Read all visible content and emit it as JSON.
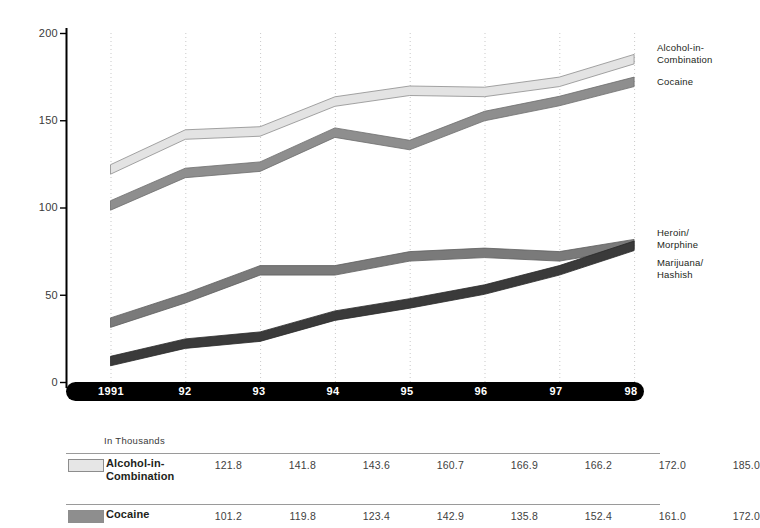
{
  "chart_data": {
    "type": "line",
    "title": "",
    "subtitle": "",
    "xlabel": "",
    "ylabel": "",
    "units_note": "In Thousands",
    "categories": [
      "1991",
      "92",
      "93",
      "94",
      "95",
      "96",
      "97",
      "98"
    ],
    "x_tick_labels": [
      "1991",
      "92",
      "93",
      "94",
      "95",
      "96",
      "97",
      "98"
    ],
    "y_tick_labels": [
      "0",
      "50",
      "100",
      "150",
      "200"
    ],
    "y_ticks": [
      0,
      50,
      100,
      150,
      200
    ],
    "ylim": [
      0,
      200
    ],
    "grid": "vertical dotted gridlines at each year",
    "legend": "inline right-side callout labels",
    "series": [
      {
        "name": "Alcohol-in-Combination",
        "label_lines": [
          "Alcohol-in-",
          "Combination"
        ],
        "color": "#e3e3e3",
        "edge": "#8d8d8d",
        "values": [
          121.8,
          141.8,
          143.6,
          160.7,
          166.9,
          166.2,
          172.0,
          185.0
        ]
      },
      {
        "name": "Cocaine",
        "label_lines": [
          "Cocaine"
        ],
        "color": "#8e8e8e",
        "edge": "#6d6d6d",
        "values": [
          101.2,
          119.8,
          123.4,
          142.9,
          135.8,
          152.4,
          161.0,
          172.0
        ]
      },
      {
        "name": "Heroin/Morphine",
        "label_lines": [
          "Heroin/",
          "Morphine"
        ],
        "color": "#7a7a7a",
        "edge": "#5e5e5e",
        "values": [
          34.0,
          48.0,
          64.0,
          64.0,
          72.0,
          74.0,
          72.0,
          79.0
        ]
      },
      {
        "name": "Marijuana/Hashish",
        "label_lines": [
          "Marijuana/",
          "Hashish"
        ],
        "color": "#3a3a3a",
        "edge": "#2a2a2a",
        "values": [
          12.0,
          22.0,
          26.0,
          38.0,
          45.0,
          53.0,
          64.0,
          78.0
        ]
      }
    ]
  },
  "axis": {
    "y_labels": [
      "200",
      "150",
      "100",
      "50",
      "0"
    ],
    "x_labels": [
      "1991",
      "92",
      "93",
      "94",
      "95",
      "96",
      "97",
      "98"
    ]
  },
  "callouts": {
    "alcohol_line1": "Alcohol-in-",
    "alcohol_line2": "Combination",
    "cocaine_line1": "Cocaine",
    "heroin_line1": "Heroin/",
    "heroin_line2": "Morphine",
    "marijuana_line1": "Marijuana/",
    "marijuana_line2": "Hashish"
  },
  "table": {
    "units_label": "In Thousands",
    "rows": [
      {
        "name_line1": "Alcohol-in-",
        "name_line2": "Combination",
        "swatch_color": "#e6e6e6",
        "values": [
          "121.8",
          "141.8",
          "143.6",
          "160.7",
          "166.9",
          "166.2",
          "172.0",
          "185.0"
        ]
      },
      {
        "name_line1": "Cocaine",
        "name_line2": "",
        "swatch_color": "#8e8e8e",
        "values": [
          "101.2",
          "119.8",
          "123.4",
          "142.9",
          "135.8",
          "152.4",
          "161.0",
          "172.0"
        ]
      }
    ]
  },
  "colors": {
    "alcohol": "#e3e3e3",
    "cocaine": "#8e8e8e",
    "heroin": "#7a7a7a",
    "marijuana": "#3a3a3a",
    "axis": "#000000",
    "gridline": "#c9c9c9"
  }
}
